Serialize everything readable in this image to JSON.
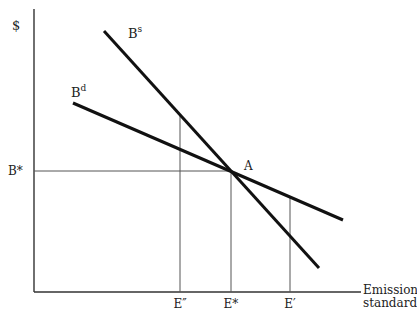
{
  "diagram": {
    "y_axis_label": "$",
    "x_axis_label_line1": "Emission",
    "x_axis_label_line2": "standard",
    "curves": {
      "supply": {
        "base": "B",
        "sup": "s"
      },
      "demand": {
        "base": "B",
        "sup": "d"
      }
    },
    "equilibrium_point_label": "A",
    "price_label": "B*",
    "x_ticks": [
      {
        "label": "E″"
      },
      {
        "label": "E*"
      },
      {
        "label": "E′"
      }
    ]
  }
}
